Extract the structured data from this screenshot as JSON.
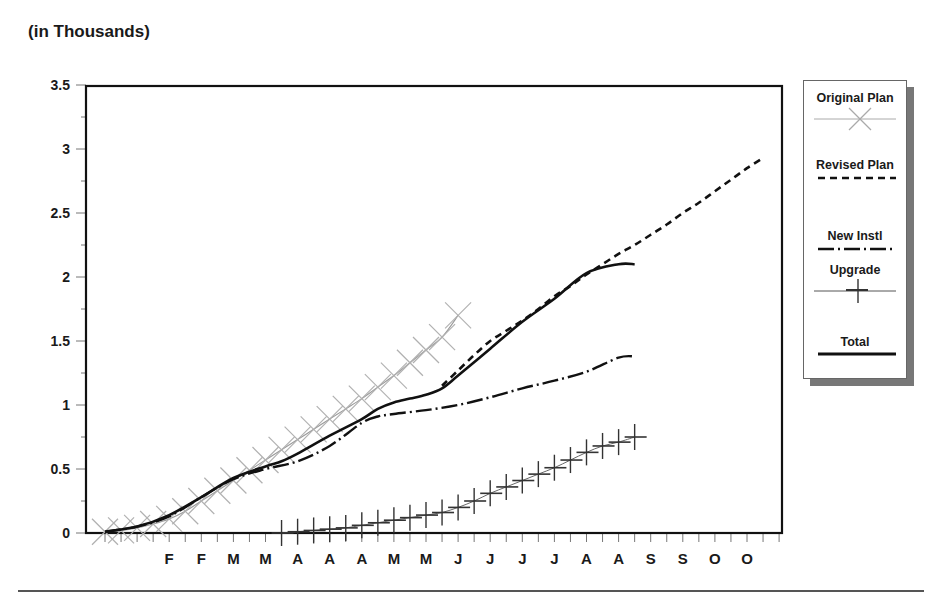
{
  "unit_label": "(in Thousands)",
  "chart_data": {
    "type": "line",
    "title": "",
    "xlabel": "",
    "ylabel": "(in Thousands)",
    "ylim": [
      0,
      3.5
    ],
    "yticks": [
      "0",
      "0.5",
      "1",
      "1.5",
      "2",
      "2.5",
      "3",
      "3.5"
    ],
    "x_tick_labels": [
      "F",
      "F",
      "M",
      "M",
      "A",
      "A",
      "A",
      "M",
      "M",
      "J",
      "J",
      "J",
      "J",
      "A",
      "A",
      "S",
      "S",
      "O",
      "O"
    ],
    "x_note": "weekly x-axis (minor ticks weekly, letters mark month abbreviations every other week)",
    "grid": false,
    "legend_position": "right",
    "series": [
      {
        "name": "Original Plan",
        "style": "thin gray line with X markers",
        "color": "#9a9a9a",
        "x_week": [
          0,
          1,
          2,
          3,
          4,
          5,
          6,
          7,
          8,
          9,
          10,
          11,
          12,
          13,
          14,
          15,
          16,
          17,
          18,
          19,
          20,
          21,
          22
        ],
        "values": [
          0.01,
          0.02,
          0.04,
          0.07,
          0.11,
          0.17,
          0.25,
          0.33,
          0.41,
          0.49,
          0.57,
          0.65,
          0.73,
          0.81,
          0.89,
          0.97,
          1.05,
          1.14,
          1.23,
          1.33,
          1.43,
          1.53,
          1.7
        ]
      },
      {
        "name": "Revised Plan",
        "style": "black dashed line",
        "color": "#111111",
        "x_week": [
          21,
          22,
          23,
          24,
          25,
          26,
          27,
          28,
          29,
          30,
          31,
          32,
          33,
          34,
          35,
          36,
          37,
          38,
          39,
          40,
          41
        ],
        "values": [
          1.15,
          1.27,
          1.39,
          1.5,
          1.58,
          1.66,
          1.75,
          1.85,
          1.93,
          2.02,
          2.1,
          2.18,
          2.25,
          2.33,
          2.41,
          2.5,
          2.58,
          2.67,
          2.76,
          2.85,
          2.93
        ]
      },
      {
        "name": "New Instl",
        "style": "black dash-dot line",
        "color": "#111111",
        "x_week": [
          0,
          2,
          4,
          6,
          8,
          10,
          12,
          14,
          16,
          17,
          18,
          20,
          22,
          24,
          26,
          28,
          30,
          32,
          33
        ],
        "values": [
          0.01,
          0.05,
          0.13,
          0.28,
          0.42,
          0.5,
          0.56,
          0.68,
          0.86,
          0.91,
          0.93,
          0.96,
          1.0,
          1.06,
          1.13,
          1.19,
          1.26,
          1.37,
          1.38
        ]
      },
      {
        "name": "Upgrade",
        "style": "thin line with + markers",
        "color": "#333333",
        "x_week": [
          11,
          12,
          13,
          14,
          15,
          16,
          17,
          18,
          19,
          20,
          21,
          22,
          23,
          24,
          25,
          26,
          27,
          28,
          29,
          30,
          31,
          32,
          33
        ],
        "values": [
          0.0,
          0.01,
          0.02,
          0.03,
          0.04,
          0.06,
          0.08,
          0.1,
          0.12,
          0.14,
          0.16,
          0.2,
          0.25,
          0.31,
          0.36,
          0.41,
          0.46,
          0.51,
          0.57,
          0.63,
          0.68,
          0.71,
          0.75
        ]
      },
      {
        "name": "Total",
        "style": "thick black solid line",
        "color": "#111111",
        "x_week": [
          0,
          2,
          4,
          6,
          8,
          10,
          11,
          12,
          14,
          16,
          17,
          18,
          19,
          20,
          21,
          22,
          24,
          26,
          28,
          30,
          32,
          33
        ],
        "values": [
          0.01,
          0.05,
          0.14,
          0.28,
          0.43,
          0.52,
          0.56,
          0.62,
          0.76,
          0.89,
          0.97,
          1.02,
          1.05,
          1.08,
          1.13,
          1.23,
          1.44,
          1.65,
          1.83,
          2.03,
          2.1,
          2.1
        ]
      }
    ]
  },
  "legend": {
    "items": [
      {
        "label": "Original Plan"
      },
      {
        "label": "Revised Plan"
      },
      {
        "label": "New Instl"
      },
      {
        "label": "Upgrade"
      },
      {
        "label": "Total"
      }
    ]
  }
}
